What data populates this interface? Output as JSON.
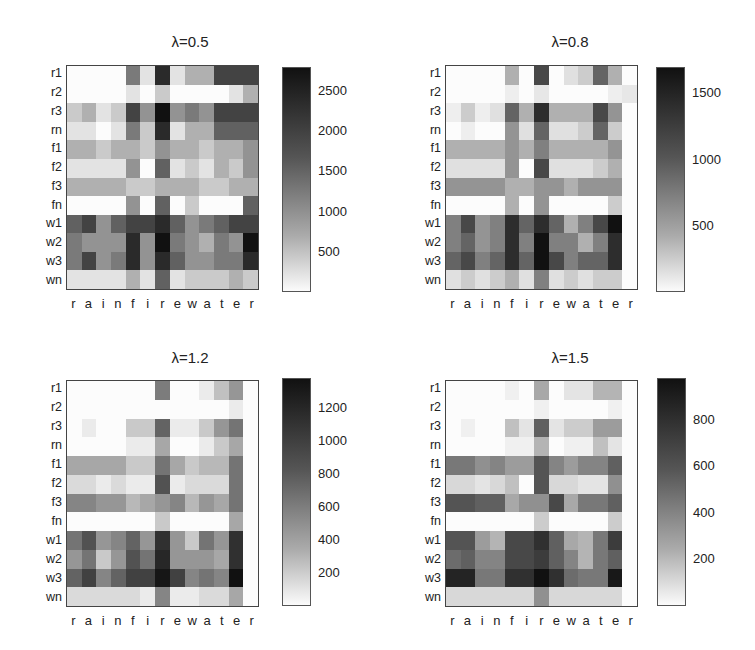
{
  "chart_data": [
    {
      "type": "heatmap",
      "title": "λ=0.5",
      "x_tick_labels": [
        "r",
        "a",
        "i",
        "n",
        "f",
        "i",
        "r",
        "e",
        "w",
        "a",
        "t",
        "e",
        "r"
      ],
      "y_tick_labels": [
        "r1",
        "r2",
        "r3",
        "rn",
        "f1",
        "f2",
        "f3",
        "fn",
        "w1",
        "w2",
        "w3",
        "wn"
      ],
      "colorbar": {
        "ticks": [
          500,
          1000,
          1500,
          2000,
          2500
        ],
        "range": [
          0,
          2800
        ],
        "colormap": "gray_reversed"
      },
      "values": [
        [
          0,
          0,
          0,
          0,
          1550,
          300,
          2500,
          300,
          900,
          900,
          2200,
          2200,
          2200
        ],
        [
          0,
          0,
          0,
          0,
          300,
          0,
          600,
          0,
          0,
          0,
          0,
          300,
          900
        ],
        [
          600,
          900,
          300,
          600,
          2200,
          1250,
          2800,
          1250,
          1550,
          1250,
          2200,
          2200,
          2200
        ],
        [
          300,
          300,
          0,
          300,
          1550,
          600,
          2500,
          300,
          900,
          900,
          1850,
          1850,
          1850
        ],
        [
          900,
          900,
          600,
          900,
          900,
          600,
          1250,
          900,
          900,
          600,
          900,
          900,
          1250
        ],
        [
          300,
          300,
          300,
          300,
          1250,
          0,
          1850,
          300,
          600,
          300,
          900,
          600,
          1250
        ],
        [
          900,
          900,
          900,
          900,
          600,
          600,
          900,
          900,
          900,
          600,
          600,
          900,
          900
        ],
        [
          0,
          0,
          0,
          0,
          1250,
          0,
          1850,
          0,
          600,
          0,
          0,
          0,
          1850
        ],
        [
          1850,
          2200,
          1250,
          1850,
          2200,
          2200,
          2500,
          1850,
          1250,
          1550,
          1850,
          2200,
          2200
        ],
        [
          1550,
          1250,
          1250,
          1250,
          2500,
          1250,
          2800,
          1550,
          1250,
          900,
          1550,
          1250,
          2800
        ],
        [
          1550,
          2200,
          1250,
          1550,
          2500,
          1250,
          2500,
          1850,
          1250,
          1250,
          1550,
          1550,
          2500
        ],
        [
          300,
          300,
          300,
          300,
          900,
          300,
          1850,
          300,
          600,
          600,
          600,
          900,
          600
        ]
      ]
    },
    {
      "type": "heatmap",
      "title": "λ=0.8",
      "x_tick_labels": [
        "r",
        "a",
        "i",
        "n",
        "f",
        "i",
        "r",
        "e",
        "w",
        "a",
        "t",
        "e",
        "r"
      ],
      "y_tick_labels": [
        "r1",
        "r2",
        "r3",
        "rn",
        "f1",
        "f2",
        "f3",
        "fn",
        "w1",
        "w2",
        "w3",
        "wn"
      ],
      "colorbar": {
        "ticks": [
          500,
          1000,
          1500
        ],
        "range": [
          0,
          1700
        ],
        "colormap": "gray_reversed"
      },
      "values": [
        [
          0,
          0,
          0,
          0,
          550,
          0,
          1300,
          0,
          200,
          350,
          1100,
          550,
          0
        ],
        [
          0,
          0,
          0,
          0,
          100,
          0,
          150,
          0,
          0,
          0,
          0,
          100,
          150
        ],
        [
          100,
          350,
          100,
          200,
          1100,
          550,
          1500,
          550,
          550,
          550,
          1300,
          750,
          0
        ],
        [
          0,
          100,
          0,
          0,
          750,
          200,
          1100,
          200,
          200,
          350,
          1100,
          350,
          0
        ],
        [
          550,
          550,
          550,
          550,
          750,
          550,
          900,
          550,
          550,
          550,
          550,
          750,
          0
        ],
        [
          200,
          200,
          200,
          200,
          750,
          0,
          1300,
          200,
          200,
          200,
          350,
          550,
          0
        ],
        [
          750,
          750,
          750,
          750,
          550,
          550,
          750,
          750,
          550,
          750,
          750,
          750,
          0
        ],
        [
          0,
          0,
          0,
          0,
          550,
          0,
          750,
          0,
          0,
          0,
          0,
          350,
          0
        ],
        [
          900,
          1300,
          750,
          900,
          1500,
          1100,
          1500,
          1100,
          550,
          900,
          1300,
          1700,
          0
        ],
        [
          900,
          1100,
          750,
          900,
          1500,
          900,
          1700,
          900,
          900,
          550,
          900,
          1500,
          0
        ],
        [
          1100,
          1300,
          900,
          1100,
          1500,
          1100,
          1700,
          1300,
          900,
          1100,
          1100,
          1500,
          0
        ],
        [
          200,
          350,
          200,
          350,
          550,
          200,
          900,
          200,
          350,
          200,
          350,
          350,
          0
        ]
      ]
    },
    {
      "type": "heatmap",
      "title": "λ=1.2",
      "x_tick_labels": [
        "r",
        "a",
        "i",
        "n",
        "f",
        "i",
        "r",
        "e",
        "w",
        "a",
        "t",
        "e",
        "r"
      ],
      "y_tick_labels": [
        "r1",
        "r2",
        "r3",
        "rn",
        "f1",
        "f2",
        "f3",
        "fn",
        "w1",
        "w2",
        "w3",
        "wn"
      ],
      "colorbar": {
        "ticks": [
          200,
          400,
          600,
          800,
          1000,
          1200
        ],
        "range": [
          0,
          1380
        ],
        "colormap": "gray_reversed"
      },
      "values": [
        [
          0,
          0,
          0,
          0,
          0,
          0,
          750,
          0,
          0,
          100,
          350,
          600,
          0
        ],
        [
          0,
          0,
          0,
          0,
          0,
          0,
          0,
          0,
          0,
          0,
          0,
          100,
          0
        ],
        [
          0,
          100,
          0,
          0,
          300,
          300,
          900,
          100,
          100,
          300,
          600,
          800,
          0
        ],
        [
          0,
          0,
          0,
          0,
          100,
          100,
          500,
          0,
          0,
          100,
          300,
          500,
          0
        ],
        [
          500,
          500,
          500,
          500,
          300,
          300,
          800,
          500,
          300,
          400,
          400,
          800,
          0
        ],
        [
          200,
          200,
          100,
          200,
          100,
          100,
          1000,
          100,
          200,
          200,
          200,
          800,
          0
        ],
        [
          700,
          700,
          600,
          600,
          400,
          500,
          600,
          700,
          400,
          600,
          500,
          800,
          0
        ],
        [
          0,
          0,
          0,
          0,
          0,
          0,
          300,
          0,
          0,
          0,
          0,
          500,
          0
        ],
        [
          800,
          1000,
          600,
          700,
          900,
          600,
          1200,
          600,
          300,
          800,
          600,
          1200,
          0
        ],
        [
          600,
          800,
          300,
          600,
          1000,
          800,
          1250,
          600,
          600,
          600,
          500,
          1200,
          0
        ],
        [
          900,
          1100,
          700,
          900,
          1100,
          1100,
          1350,
          1100,
          700,
          800,
          700,
          1380,
          0
        ],
        [
          200,
          200,
          200,
          200,
          200,
          100,
          700,
          100,
          100,
          200,
          200,
          500,
          0
        ]
      ]
    },
    {
      "type": "heatmap",
      "title": "λ=1.5",
      "x_tick_labels": [
        "r",
        "a",
        "i",
        "n",
        "f",
        "i",
        "r",
        "e",
        "w",
        "a",
        "t",
        "e",
        "r"
      ],
      "y_tick_labels": [
        "r1",
        "r2",
        "r3",
        "rn",
        "f1",
        "f2",
        "f3",
        "fn",
        "w1",
        "w2",
        "w3",
        "wn"
      ],
      "colorbar": {
        "ticks": [
          200,
          400,
          600,
          800
        ],
        "range": [
          0,
          980
        ],
        "colormap": "gray_reversed"
      },
      "values": [
        [
          0,
          0,
          0,
          0,
          50,
          0,
          350,
          0,
          100,
          100,
          300,
          300,
          0
        ],
        [
          0,
          0,
          0,
          0,
          0,
          0,
          50,
          0,
          0,
          0,
          0,
          50,
          0
        ],
        [
          0,
          50,
          0,
          0,
          250,
          100,
          650,
          100,
          200,
          200,
          400,
          400,
          0
        ],
        [
          0,
          0,
          0,
          0,
          50,
          50,
          300,
          0,
          50,
          50,
          250,
          100,
          0
        ],
        [
          550,
          550,
          450,
          500,
          400,
          400,
          700,
          500,
          400,
          500,
          500,
          650,
          0
        ],
        [
          150,
          150,
          100,
          150,
          250,
          0,
          700,
          150,
          150,
          100,
          100,
          450,
          0
        ],
        [
          700,
          700,
          650,
          650,
          350,
          450,
          450,
          750,
          350,
          550,
          550,
          650,
          0
        ],
        [
          0,
          0,
          0,
          0,
          0,
          0,
          200,
          0,
          0,
          0,
          0,
          200,
          0
        ],
        [
          700,
          700,
          400,
          300,
          750,
          750,
          850,
          650,
          350,
          300,
          550,
          800,
          0
        ],
        [
          600,
          650,
          500,
          500,
          750,
          750,
          800,
          650,
          500,
          300,
          550,
          650,
          0
        ],
        [
          900,
          900,
          550,
          550,
          850,
          850,
          980,
          850,
          600,
          550,
          550,
          950,
          0
        ],
        [
          150,
          150,
          150,
          150,
          150,
          150,
          450,
          150,
          150,
          150,
          150,
          150,
          0
        ]
      ]
    }
  ],
  "panels": [
    {
      "title": "λ=0.5",
      "cbar_ticks": [
        "2500",
        "2000",
        "1500",
        "1000",
        "500"
      ]
    },
    {
      "title": "λ=0.8",
      "cbar_ticks": [
        "1500",
        "1000",
        "500"
      ]
    },
    {
      "title": "λ=1.2",
      "cbar_ticks": [
        "1200",
        "1000",
        "800",
        "600",
        "400",
        "200"
      ]
    },
    {
      "title": "λ=1.5",
      "cbar_ticks": [
        "800",
        "600",
        "400",
        "200"
      ]
    }
  ],
  "x_labels": [
    "r",
    "a",
    "i",
    "n",
    "f",
    "i",
    "r",
    "e",
    "w",
    "a",
    "t",
    "e",
    "r"
  ],
  "y_labels": [
    "r1",
    "r2",
    "r3",
    "rn",
    "f1",
    "f2",
    "f3",
    "fn",
    "w1",
    "w2",
    "w3",
    "wn"
  ]
}
